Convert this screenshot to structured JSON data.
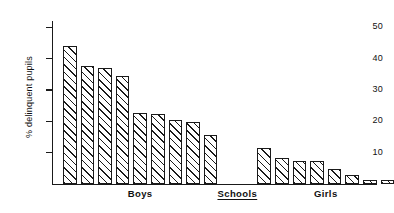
{
  "chart_data": {
    "type": "bar",
    "title": "",
    "subtitle": "",
    "xlabel": "Schools",
    "ylabel": "% delinquent pupils",
    "ylim": [
      0,
      52
    ],
    "ytick_values": [
      10,
      20,
      30,
      40,
      50
    ],
    "ytick_labels": [
      "10",
      "20",
      "30",
      "40",
      "50"
    ],
    "grid": false,
    "legend": null,
    "legend_position": "none",
    "categories": [
      "B1",
      "B2",
      "B3",
      "B4",
      "B5",
      "B6",
      "B7",
      "B8",
      "B9",
      "G1",
      "G2",
      "G3",
      "G4",
      "G5",
      "G6",
      "G7",
      "G8"
    ],
    "values": [
      44.0,
      37.5,
      37.0,
      34.5,
      22.5,
      22.3,
      20.5,
      19.8,
      15.5,
      11.5,
      8.3,
      7.5,
      7.4,
      4.8,
      3.0,
      1.4,
      1.2
    ],
    "groups": [
      {
        "label": "Boys",
        "underlined": false,
        "start_index": 0,
        "count": 9
      },
      {
        "label": "Girls",
        "underlined": false,
        "start_index": 9,
        "count": 8
      }
    ],
    "axis_label_center": {
      "label": "Schools",
      "underlined": true
    },
    "bar_style": {
      "fill": "hatched-diagonal",
      "hatch_direction": "forward-slash",
      "edge_color": "#1a1a1a",
      "face_color": "#ffffff"
    },
    "annotations": []
  },
  "axis": {
    "y_label": "% delinquent pupils",
    "ticks": [
      "50",
      "40",
      "30",
      "20",
      "10"
    ]
  },
  "labels": {
    "boys": "Boys",
    "schools": "Schools",
    "girls": "Girls"
  },
  "colors": {
    "ink": "#1a1a1a",
    "background": "#ffffff"
  }
}
